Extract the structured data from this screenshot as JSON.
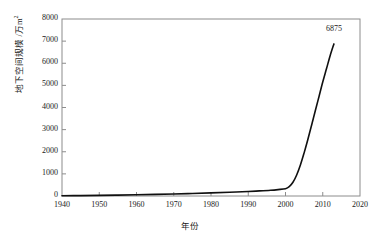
{
  "chart_data": {
    "type": "line",
    "title": "",
    "subtitle": "",
    "xlabel": "年份",
    "ylabel": "地下空间规模 /万m²",
    "ylabel_text": "地下空间规模 /万m",
    "ylabel_sup": "2",
    "xlim": [
      1940,
      2020
    ],
    "ylim": [
      0,
      8000
    ],
    "xticks": [
      "1940",
      "1950",
      "1960",
      "1970",
      "1980",
      "1990",
      "2000",
      "2010",
      "2020"
    ],
    "xtick_values": [
      1940,
      1950,
      1960,
      1970,
      1980,
      1990,
      2000,
      2010,
      2020
    ],
    "yticks": [
      "0",
      "1000",
      "2000",
      "3000",
      "4000",
      "5000",
      "6000",
      "7000",
      "8000"
    ],
    "ytick_values": [
      0,
      1000,
      2000,
      3000,
      4000,
      5000,
      6000,
      7000,
      8000
    ],
    "grid": false,
    "legend": null,
    "legend_position": "none",
    "line_color": "#101010",
    "frame_color": "#8c8c8c",
    "background_color": "#ffffff",
    "series": [
      {
        "name": "地下空间规模",
        "x": [
          1940,
          1945,
          1950,
          1955,
          1960,
          1965,
          1970,
          1975,
          1980,
          1985,
          1990,
          1993,
          1996,
          1998,
          2000,
          2001,
          2002,
          2003,
          2004,
          2005,
          2006,
          2007,
          2008,
          2009,
          2010,
          2011,
          2012,
          2013
        ],
        "values": [
          10,
          18,
          28,
          40,
          55,
          72,
          92,
          115,
          140,
          170,
          205,
          230,
          260,
          290,
          330,
          420,
          620,
          950,
          1400,
          1950,
          2550,
          3200,
          3850,
          4500,
          5150,
          5750,
          6350,
          6875
        ]
      }
    ],
    "annotations": [
      {
        "label": "6875",
        "x": 2013,
        "y": 6875,
        "dx": 6,
        "dy": -14
      }
    ]
  }
}
